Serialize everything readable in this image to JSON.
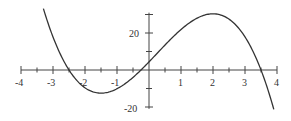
{
  "chart_data": {
    "type": "line",
    "title": "",
    "xlabel": "",
    "ylabel": "",
    "xlim": [
      -4,
      4
    ],
    "ylim": [
      -20,
      30
    ],
    "x_ticks": [
      -4,
      -3.5,
      -3,
      -2.5,
      -2,
      -1.5,
      -1,
      -0.5,
      0,
      0.5,
      1,
      1.5,
      2,
      2.5,
      3,
      3.5,
      4
    ],
    "x_tick_labels": [
      "-4",
      "-3",
      "-2",
      "-1",
      "1",
      "2",
      "3",
      "4"
    ],
    "y_tick_labels": [
      "20",
      "-20"
    ],
    "y_ticks": [
      -20,
      -10,
      10,
      20,
      30
    ],
    "grid": false,
    "series": [
      {
        "name": "f(x)",
        "formula": "-2(x+2.5)(x+0.25)(x-3.5)",
        "x": [
          -3.3,
          -3.0,
          -2.5,
          -2.0,
          -1.5,
          -1.0,
          -0.5,
          -0.25,
          0,
          0.5,
          1.0,
          1.5,
          2.0,
          2.5,
          3.0,
          3.5,
          3.9
        ],
        "y": [
          33.2,
          18.2,
          0,
          -9.9,
          -12.8,
          -10.7,
          -5.3,
          0,
          4.4,
          13.5,
          21.1,
          26.3,
          27.0,
          22.1,
          10.4,
          0,
          -21.2
        ]
      }
    ]
  },
  "labels": {
    "x": [
      "-4",
      "-3",
      "-2",
      "-1",
      "1",
      "2",
      "3",
      "4"
    ],
    "y_top": "20",
    "y_bottom": "-20"
  },
  "colors": {
    "axis": "#444444",
    "curve": "#333333"
  }
}
